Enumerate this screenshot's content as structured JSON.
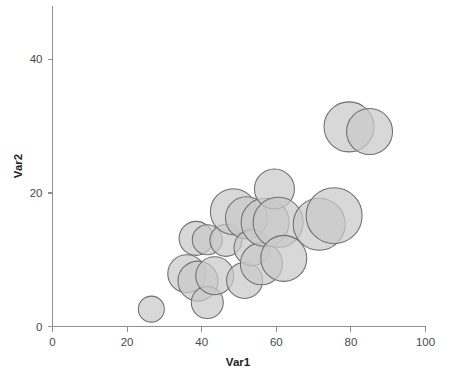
{
  "chart_data": {
    "type": "scatter",
    "subtype": "bubble",
    "title": "",
    "subtitle": "",
    "xlabel": "Var1",
    "ylabel": "Var2",
    "xlim": [
      0,
      100
    ],
    "ylim": [
      0,
      48
    ],
    "xticks": [
      0,
      20,
      40,
      60,
      80,
      100
    ],
    "yticks": [
      0,
      20,
      40
    ],
    "xtick_labels": [
      "0",
      "20",
      "40",
      "60",
      "80",
      "100"
    ],
    "ytick_labels": [
      "0",
      "20",
      "40"
    ],
    "grid": false,
    "legend": null,
    "annotations": [],
    "bubble_fill": "#c9c9c9",
    "bubble_stroke": "#6f6f6f",
    "axis_color": "#8f8f8f",
    "background": "#ffffff",
    "series": [
      {
        "name": "Var3 (bubble size)",
        "points": [
          {
            "x": 26.5,
            "y": 2.6,
            "size": 13
          },
          {
            "x": 36.0,
            "y": 7.9,
            "size": 19
          },
          {
            "x": 38.5,
            "y": 13.2,
            "size": 17
          },
          {
            "x": 39.0,
            "y": 6.8,
            "size": 20
          },
          {
            "x": 41.5,
            "y": 13.0,
            "size": 15
          },
          {
            "x": 41.5,
            "y": 3.6,
            "size": 16
          },
          {
            "x": 43.5,
            "y": 7.6,
            "size": 19
          },
          {
            "x": 46.5,
            "y": 12.9,
            "size": 16
          },
          {
            "x": 48.5,
            "y": 17.2,
            "size": 23
          },
          {
            "x": 51.5,
            "y": 6.9,
            "size": 18
          },
          {
            "x": 52.0,
            "y": 16.3,
            "size": 21
          },
          {
            "x": 53.5,
            "y": 11.8,
            "size": 18
          },
          {
            "x": 56.0,
            "y": 9.4,
            "size": 21
          },
          {
            "x": 57.0,
            "y": 15.6,
            "size": 24
          },
          {
            "x": 59.5,
            "y": 20.6,
            "size": 20
          },
          {
            "x": 60.5,
            "y": 15.6,
            "size": 25
          },
          {
            "x": 62.0,
            "y": 10.2,
            "size": 23
          },
          {
            "x": 71.5,
            "y": 15.3,
            "size": 26
          },
          {
            "x": 75.5,
            "y": 16.6,
            "size": 28
          },
          {
            "x": 79.5,
            "y": 29.9,
            "size": 25
          },
          {
            "x": 85.0,
            "y": 29.2,
            "size": 23
          }
        ]
      }
    ]
  },
  "axes": {
    "x_title": "Var1",
    "y_title": "Var2"
  },
  "icons": {
    "chart_type": "bubble-chart-icon"
  }
}
